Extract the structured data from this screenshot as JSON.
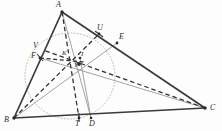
{
  "figure": {
    "kind": "geometry-diagram",
    "background_color": "#fdfdfd",
    "stroke_colors": {
      "triangle": "#3a3a3a",
      "thin_solid": "#7e7e8a",
      "dashed": "#2e2e2e",
      "dotted_circle": "#b9a89a",
      "label": "#2b2b2b"
    },
    "canvas": {
      "width": 222,
      "height": 131
    }
  },
  "points": {
    "A": {
      "label": "A",
      "x": 62,
      "y": 12,
      "lx": 56,
      "ly": 2
    },
    "B": {
      "label": "B",
      "x": 14,
      "y": 118,
      "lx": 5,
      "ly": 118
    },
    "C": {
      "label": "C",
      "x": 205,
      "y": 108,
      "lx": 210,
      "ly": 108
    },
    "D": {
      "label": "D",
      "x": 91,
      "y": 118,
      "lx": 91,
      "ly": 121
    },
    "T": {
      "label": "T",
      "x": 79,
      "y": 118,
      "lx": 76,
      "ly": 121
    },
    "E": {
      "label": "E",
      "x": 117,
      "y": 43,
      "lx": 120,
      "ly": 35
    },
    "U": {
      "label": "U",
      "x": 99,
      "y": 34,
      "lx": 98,
      "ly": 26
    },
    "F": {
      "label": "F",
      "x": 40,
      "y": 58,
      "lx": 31,
      "ly": 54
    },
    "V": {
      "label": "V",
      "x": 43,
      "y": 50,
      "lx": 34,
      "ly": 44
    },
    "K": {
      "label": "K",
      "x": 66,
      "y": 58,
      "lx": 62,
      "ly": 52
    },
    "I": {
      "label": "I",
      "x": 80,
      "y": 58,
      "lx": 80,
      "ly": 52
    },
    "Y": {
      "label": "Y",
      "x": 77,
      "y": 68,
      "lx": 74,
      "ly": 65
    }
  },
  "incircle": {
    "center_x": 70,
    "center_y": 76,
    "radius_x": 45,
    "radius_y": 43,
    "style": "dotted"
  },
  "segments": [
    {
      "name": "side-AB",
      "from": "A",
      "to": "B",
      "style": "solid-thick"
    },
    {
      "name": "side-AC",
      "from": "A",
      "to": "C",
      "style": "solid-thick"
    },
    {
      "name": "side-BC",
      "from": "B",
      "to": "C",
      "style": "solid-thick"
    },
    {
      "name": "cevian-A-T",
      "from": "A",
      "to": "T",
      "style": "dashed"
    },
    {
      "name": "cevian-A-D",
      "from": "A",
      "to": "D",
      "style": "thin-solid"
    },
    {
      "name": "cevian-B-E",
      "from": "B",
      "to": "E",
      "style": "thin-solid"
    },
    {
      "name": "cevian-B-U",
      "from": "B",
      "to": "U",
      "style": "dashed"
    },
    {
      "name": "cevian-C-F",
      "from": "C",
      "to": "F",
      "style": "thin-solid"
    },
    {
      "name": "cevian-C-V",
      "from": "C",
      "to": "V",
      "style": "dashed"
    },
    {
      "name": "chord-F-I",
      "from": "F",
      "to": "I",
      "style": "dashed"
    },
    {
      "name": "segment-D-I",
      "from": "D",
      "to": "I",
      "style": "thin-solid"
    }
  ],
  "tick_marks": [
    {
      "name": "tick-on-AC-at-U",
      "x": 99,
      "y": 34
    },
    {
      "name": "tick-on-AB-at-F",
      "x": 40,
      "y": 58
    },
    {
      "name": "tick-on-BC-at-T",
      "x": 79,
      "y": 118
    }
  ]
}
